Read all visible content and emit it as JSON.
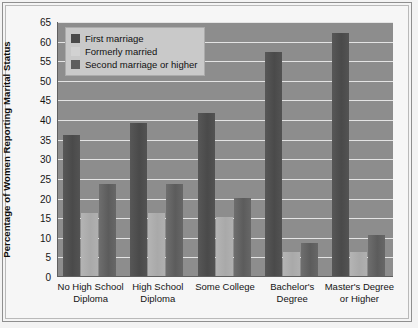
{
  "chart_data": {
    "type": "bar",
    "title": "",
    "xlabel": "",
    "ylabel": "Percentage of Women Reporting Marital Status",
    "ylim": [
      0,
      65
    ],
    "ytick_step": 5,
    "yticks": [
      "65",
      "60",
      "55",
      "50",
      "45",
      "40",
      "35",
      "30",
      "25",
      "20",
      "15",
      "10",
      "5",
      "0"
    ],
    "grid": true,
    "legend_position": "top-left",
    "categories": [
      "No High School Diploma",
      "High School Diploma",
      "Some College",
      "Bachelor's Degree",
      "Master's Degree or Higher"
    ],
    "category_lines": [
      [
        "No High School",
        "Diploma"
      ],
      [
        "High School",
        "Diploma"
      ],
      [
        "Some College"
      ],
      [
        "Bachelor's",
        "Degree"
      ],
      [
        "Master's Degree",
        "or Higher"
      ]
    ],
    "series": [
      {
        "name": "First marriage",
        "color": "#4a4a4a",
        "values": [
          36.0,
          39.0,
          41.5,
          57.0,
          62.0
        ]
      },
      {
        "name": "Formerly married",
        "color": "#d2d2d2",
        "values": [
          16.0,
          16.0,
          15.0,
          6.0,
          6.0
        ]
      },
      {
        "name": "Second marriage or higher",
        "color": "#5e5e5e",
        "values": [
          23.5,
          23.5,
          20.0,
          8.5,
          10.5
        ]
      }
    ]
  },
  "legend": {
    "entries": [
      {
        "label": "First marriage"
      },
      {
        "label": "Formerly married"
      },
      {
        "label": "Second marriage or higher"
      }
    ]
  },
  "colors": {
    "plot_background": "#8d8d8d",
    "gridline": "#e4e4e4",
    "axis": "#5f5f5f",
    "legend_background": "#c9c9c9",
    "page_background": "#f4f4f4"
  }
}
